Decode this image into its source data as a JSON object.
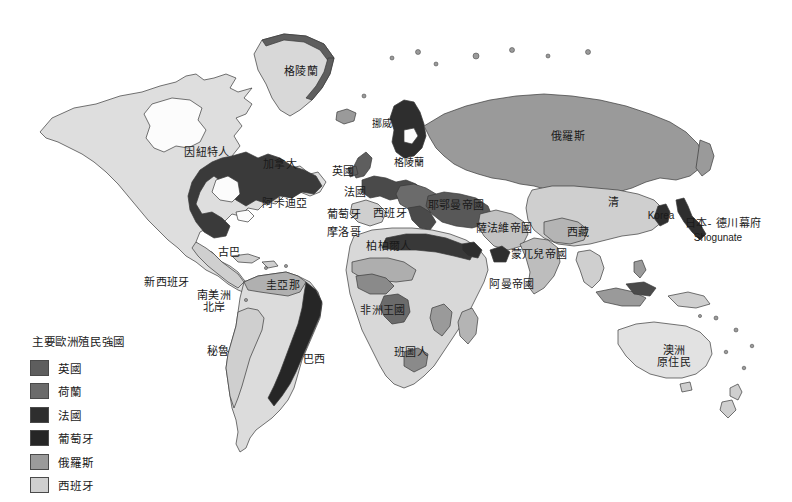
{
  "map": {
    "title": "Major European Colonial Powers World Map",
    "background_color": "#ffffff",
    "outline_color": "#3a3a3a"
  },
  "legend": {
    "title": "主要歐洲殖民強國",
    "items": [
      {
        "label": "英國",
        "color": "#5e5e5e"
      },
      {
        "label": "荷蘭",
        "color": "#6b6b6b"
      },
      {
        "label": "法國",
        "color": "#2e2e2e"
      },
      {
        "label": "葡萄牙",
        "color": "#262626"
      },
      {
        "label": "俄羅斯",
        "color": "#9a9a9a"
      },
      {
        "label": "西班牙",
        "color": "#cfcfcf"
      }
    ]
  },
  "labels": [
    {
      "name": "greenland",
      "text": "格陵蘭",
      "x": 301,
      "y": 72
    },
    {
      "name": "inuit",
      "text": "因紐特人",
      "x": 207,
      "y": 153
    },
    {
      "name": "canada",
      "text": "加拿大",
      "x": 280,
      "y": 165
    },
    {
      "name": "acadia",
      "text": "阿卡迪亞",
      "x": 285,
      "y": 204
    },
    {
      "name": "cuba",
      "text": "古巴",
      "x": 229,
      "y": 253
    },
    {
      "name": "new-spain",
      "text": "新西班牙",
      "x": 167,
      "y": 283
    },
    {
      "name": "guyana",
      "text": "圭亞那",
      "x": 283,
      "y": 286
    },
    {
      "name": "north-coast-sa",
      "text": "南美洲\n北岸",
      "x": 214,
      "y": 302
    },
    {
      "name": "peru",
      "text": "秘魯",
      "x": 218,
      "y": 352
    },
    {
      "name": "brazil",
      "text": "巴西",
      "x": 314,
      "y": 360
    },
    {
      "name": "norway",
      "text": "挪威",
      "x": 382,
      "y": 124
    },
    {
      "name": "sweden-baltic",
      "text": "格陵蘭",
      "x": 409,
      "y": 163
    },
    {
      "name": "britain",
      "text": "英國",
      "x": 343,
      "y": 172
    },
    {
      "name": "france",
      "text": "法國",
      "x": 355,
      "y": 193
    },
    {
      "name": "portugal",
      "text": "葡萄牙",
      "x": 344,
      "y": 215
    },
    {
      "name": "spain",
      "text": "西班牙",
      "x": 390,
      "y": 214
    },
    {
      "name": "morocco",
      "text": "摩洛哥",
      "x": 344,
      "y": 233
    },
    {
      "name": "ottoman-empire",
      "text": "耶鄂曼帝國",
      "x": 456,
      "y": 206
    },
    {
      "name": "safavid-empire",
      "text": "薩法維帝國",
      "x": 504,
      "y": 229
    },
    {
      "name": "berbers",
      "text": "柏柏爾人",
      "x": 389,
      "y": 247
    },
    {
      "name": "african-kingdoms",
      "text": "非洲王國",
      "x": 383,
      "y": 311
    },
    {
      "name": "bantu",
      "text": "班圖人",
      "x": 411,
      "y": 353
    },
    {
      "name": "omani-empire",
      "text": "阿曼帝國",
      "x": 512,
      "y": 285
    },
    {
      "name": "mughal-empire",
      "text": "蒙兀兒帝國",
      "x": 539,
      "y": 255
    },
    {
      "name": "russia",
      "text": "俄羅斯",
      "x": 568,
      "y": 137
    },
    {
      "name": "qing",
      "text": "清",
      "x": 614,
      "y": 203
    },
    {
      "name": "tibet",
      "text": "西藏",
      "x": 578,
      "y": 233
    },
    {
      "name": "australia",
      "text": "澳洲\n原住民",
      "x": 674,
      "y": 357
    }
  ],
  "latin_labels": [
    {
      "name": "korea",
      "text": "Korea",
      "x": 661,
      "y": 216
    },
    {
      "name": "japan-shogunate",
      "text": "日本- 德川幕府",
      "x": 723,
      "y": 224
    },
    {
      "name": "shogunate-roman",
      "text": "Shogunate",
      "x": 718,
      "y": 238
    }
  ]
}
